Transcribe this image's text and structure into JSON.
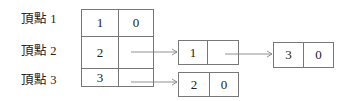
{
  "vertices": [
    {
      "label": "頂點 1",
      "index": "1",
      "link": "0"
    },
    {
      "label": "頂點 2",
      "index": "2",
      "link": ""
    },
    {
      "label": "頂點 3",
      "index": "3",
      "link": ""
    }
  ],
  "nodes": [
    {
      "id": "node-a",
      "value": "1",
      "link": ""
    },
    {
      "id": "node-b",
      "value": "2",
      "link": "0"
    },
    {
      "id": "node-c",
      "value": "3",
      "link": "0"
    }
  ]
}
